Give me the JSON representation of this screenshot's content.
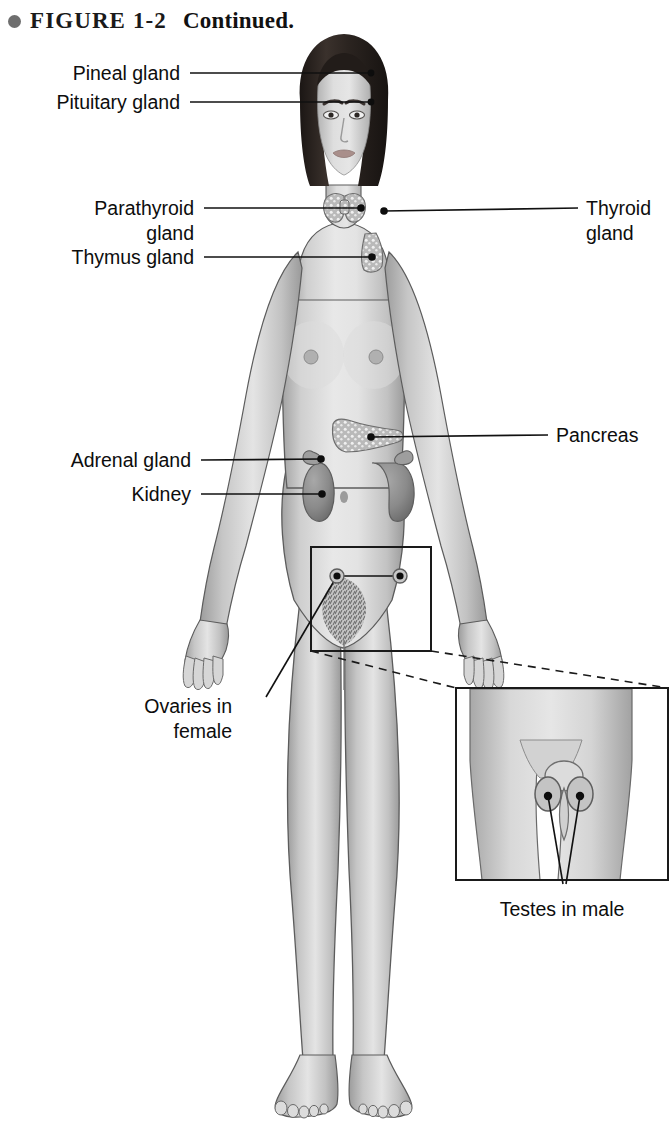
{
  "caption": {
    "bullet_icon": "filled-circle-icon",
    "figure_number": "FIGURE 1-2",
    "continued_text": "Continued."
  },
  "figure": {
    "inset_subject": "Male pelvis detail showing testes",
    "colors": {
      "skin": "#c9c9c9",
      "skin_light": "#e2e2e2",
      "skin_shadow": "#9a9a9a",
      "hair": "#2a2320",
      "organ": "#8d8d8d",
      "organ_dark": "#6b6b6b",
      "gland_speckle": "#b5b5b5",
      "outline": "#4a4a4a",
      "leader_line": "#111111",
      "label_text": "#0d0d0d",
      "callout_box": "#1a1a1a",
      "background": "#ffffff"
    }
  },
  "labels": [
    {
      "id": "pineal-gland",
      "text": "Pineal gland",
      "align": "right",
      "x": 180,
      "y": 61,
      "leader": {
        "x1": 190,
        "y1": 73,
        "x2": 371,
        "y2": 73,
        "dot": true
      }
    },
    {
      "id": "pituitary-gland",
      "text": "Pituitary gland",
      "align": "right",
      "x": 180,
      "y": 90,
      "leader": {
        "x1": 190,
        "y1": 102,
        "x2": 371,
        "y2": 102,
        "dot": true
      }
    },
    {
      "id": "parathyroid-gland",
      "text": "Parathyroid\ngland",
      "align": "right",
      "x": 194,
      "y": 196,
      "leader": {
        "x1": 204,
        "y1": 208,
        "x2": 361,
        "y2": 208,
        "dot": true
      }
    },
    {
      "id": "thymus-gland",
      "text": "Thymus gland",
      "align": "right",
      "x": 194,
      "y": 245,
      "leader": {
        "x1": 204,
        "y1": 257,
        "x2": 372,
        "y2": 257,
        "dot": true
      }
    },
    {
      "id": "thyroid-gland",
      "text": "Thyroid\ngland",
      "align": "left",
      "x": 586,
      "y": 196,
      "leader": {
        "x1": 578,
        "y1": 208,
        "x2": 384,
        "y2": 211,
        "dot": true
      }
    },
    {
      "id": "pancreas",
      "text": "Pancreas",
      "align": "left",
      "x": 556,
      "y": 423,
      "leader": {
        "x1": 548,
        "y1": 435,
        "x2": 371,
        "y2": 437,
        "dot": true
      }
    },
    {
      "id": "adrenal-gland",
      "text": "Adrenal gland",
      "align": "right",
      "x": 191,
      "y": 448,
      "leader": {
        "x1": 201,
        "y1": 460,
        "x2": 321,
        "y2": 459,
        "dot": true
      }
    },
    {
      "id": "kidney",
      "text": "Kidney",
      "align": "right",
      "x": 191,
      "y": 482,
      "leader": {
        "x1": 201,
        "y1": 494,
        "x2": 322,
        "y2": 494,
        "dot": true
      }
    },
    {
      "id": "ovaries-in-female",
      "text": "Ovaries in\nfemale",
      "align": "right",
      "x": 232,
      "y": 694,
      "leader": null
    },
    {
      "id": "testes-in-male",
      "text": "Testes in male",
      "align": "center",
      "x": 562,
      "y": 897,
      "leader": null
    }
  ],
  "callout": {
    "box": {
      "x": 311,
      "y": 547,
      "width": 120,
      "height": 104
    },
    "ovary_dots": [
      {
        "x": 337,
        "y": 576
      },
      {
        "x": 400,
        "y": 576
      }
    ]
  },
  "inset": {
    "box": {
      "x": 456,
      "y": 688,
      "width": 212,
      "height": 192
    },
    "testes_dots": [
      {
        "x": 550,
        "y": 796
      },
      {
        "x": 578,
        "y": 796
      }
    ],
    "converge_point": {
      "x": 564,
      "y": 883
    }
  }
}
